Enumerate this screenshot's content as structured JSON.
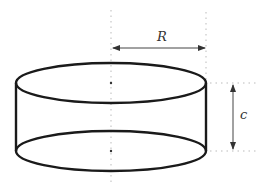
{
  "diagram": {
    "labels": {
      "radius": "R",
      "height": "c"
    },
    "colors": {
      "stroke": "#1a1a1a",
      "guide": "#bbbbbb",
      "arrow": "#444444"
    }
  }
}
